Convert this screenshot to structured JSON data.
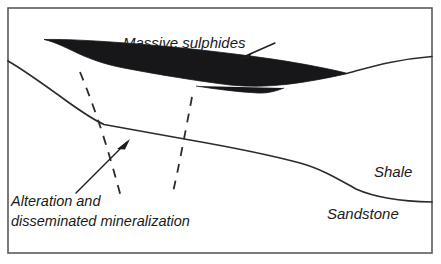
{
  "figure": {
    "type": "geological-cross-section",
    "background_color": "#ffffff",
    "frame": {
      "stroke_color": "#5a5a5a",
      "x": 8,
      "y": 8,
      "width": 424,
      "height": 245
    }
  },
  "labels": {
    "massive_sulphides": "Massive sulphides",
    "shale": "Shale",
    "sandstone": "Sandstone",
    "alteration_line1": "Alteration and",
    "alteration_line2": "disseminated mineralization"
  },
  "units": [
    {
      "name": "Massive sulphides",
      "fill_color": "#17171a",
      "description": "Lens-shaped dark ore body tapering to points at both ends"
    },
    {
      "name": "Shale",
      "fill_color": "#ffffff",
      "position": "above contact"
    },
    {
      "name": "Sandstone",
      "fill_color": "#ffffff",
      "position": "below contact"
    }
  ],
  "features": [
    {
      "name": "Alteration and disseminated mineralization",
      "style": "dashed",
      "count": 2,
      "stroke_color": "#2b2b2b"
    },
    {
      "name": "Shale-Sandstone contact",
      "style": "solid",
      "stroke_color": "#2b2b2b"
    }
  ],
  "geometry": {
    "sulphide_outline": "M 44,40 C 60,44 74,53 92,60 C 120,70 170,78 215,84 C 260,90 310,80 348,73 C 330,66 300,58 262,54 C 210,48 150,44 100,41 C 80,40 60,39 44,40 Z",
    "sulphide_body_path": "M 44,39.5 C 56,42 68,49 84,56 C 96,61 108,65 124,68 C 150,73 190,80 230,85 C 268,89 305,83 348,73.5 C 330,69 305,64 272,59 C 230,53 178,47 132,43.5 C 100,41 66,39 44,39.5 Z",
    "sulphide_notch": "M 196,86 C 215,89 238,92 258,93 C 268,93.5 276,91 284,88",
    "sulphide_tail_right": "M 348,73 C 368,68 390,60 432,56.5",
    "contact_line": "M 8,61 C 24,70 46,86 68,102 C 82,112 94,120 104,124.5 C 118,127 150,133 190,140 C 230,147 270,155 300,163 C 322,169 340,180 356,189 C 376,198 406,201.5 432,202",
    "dashed_left": "M 80,72 C 90,96 102,130 110,158 C 116,178 119,190 121,197",
    "dashed_right": "M 192,97 C 188,118 182,150 177,174 C 174,187 173,193 172,197",
    "leader_sulphides": "M 275,43 L 241,58",
    "leader_alteration": "M 76,193 L 127,142"
  },
  "label_positions": {
    "massive_sulphides": {
      "x": 123,
      "y": 48
    },
    "shale": {
      "x": 374,
      "y": 177
    },
    "sandstone": {
      "x": 327,
      "y": 219
    },
    "alteration_line1": {
      "x": 11,
      "y": 206
    },
    "alteration_line2": {
      "x": 11,
      "y": 226
    }
  }
}
